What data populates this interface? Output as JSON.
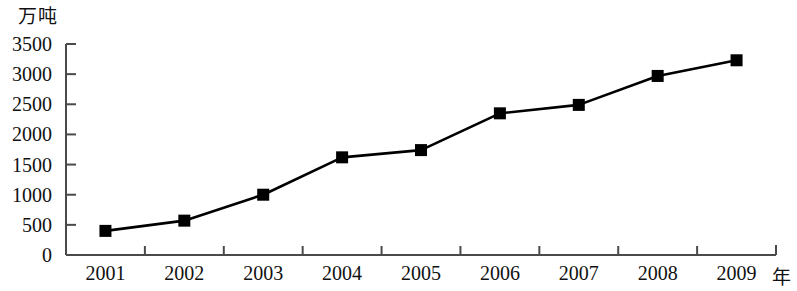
{
  "chart_data": {
    "type": "line",
    "title": "",
    "subtitle": "",
    "xlabel": "年",
    "ylabel": "万吨",
    "categories": [
      "2001",
      "2002",
      "2003",
      "2004",
      "2005",
      "2006",
      "2007",
      "2008",
      "2009"
    ],
    "values": [
      400,
      570,
      1000,
      1620,
      1740,
      2350,
      2490,
      2970,
      3230
    ],
    "x": [
      2001,
      2002,
      2003,
      2004,
      2005,
      2006,
      2007,
      2008,
      2009
    ],
    "ylim": [
      0,
      3500
    ],
    "yticks": [
      0,
      500,
      1000,
      1500,
      2000,
      2500,
      3000,
      3500
    ],
    "ytick_labels": [
      "0",
      "500",
      "1000",
      "1500",
      "2000",
      "2500",
      "3000",
      "3500"
    ],
    "xtick_labels": [
      "2001",
      "2002",
      "2003",
      "2004",
      "2005",
      "2006",
      "2007",
      "2008",
      "2009"
    ],
    "grid": false,
    "legend": false,
    "legend_position": "none",
    "series": [
      {
        "name": "",
        "values": [
          400,
          570,
          1000,
          1620,
          1740,
          2350,
          2490,
          2970,
          3230
        ],
        "color": "#000000",
        "marker": "square",
        "marker_color": "#000000"
      }
    ],
    "annotations": []
  },
  "axes": {
    "y_unit": "万吨",
    "x_unit": "年",
    "axis_color": "#4a4a4a",
    "line_color": "#000000",
    "marker_color": "#000000",
    "background": "#ffffff"
  }
}
